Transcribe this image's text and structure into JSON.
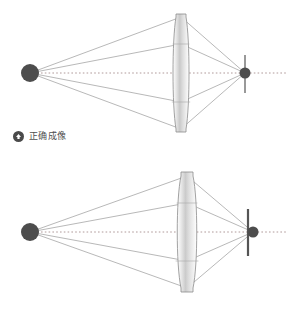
{
  "page": {
    "background_color": "#ffffff",
    "width": 290,
    "height": 309
  },
  "diagrams": [
    {
      "id": "correct",
      "caption": "正确成像",
      "bullet_icon": "up-arrow-icon",
      "bullet_color": "#4a4a4a",
      "text_color": "#4f4f4f",
      "object_point": {
        "x": 30,
        "y": 73,
        "radius": 9,
        "color": "#4d4d4d"
      },
      "lens": {
        "center_x": 181,
        "center_y": 73,
        "half_height": 56,
        "half_width": 9,
        "outline_color": "#8a8a8a",
        "fill_color": "#d8d8d8"
      },
      "sensor_plane": {
        "x": 245,
        "top_y": 55,
        "bottom_y": 93,
        "color": "#6e6e6e",
        "width": 1.4
      },
      "focus_point": {
        "x": 245,
        "y": 73,
        "radius": 5.5,
        "color": "#4d4d4d"
      },
      "optical_axis": {
        "y": 73,
        "start_x": 22,
        "end_x": 286,
        "color": "#b09a9a",
        "style": "dotted"
      },
      "ray_color": "#9a9a9a",
      "ray_heights": [
        17,
        44,
        102,
        129
      ],
      "focus_state": "on-sensor"
    },
    {
      "id": "incorrect",
      "caption": "不正确成像",
      "bullet_icon": "up-arrow-icon",
      "bullet_color": "#4a4a4a",
      "text_color": "#4f4f4f",
      "object_point": {
        "x": 30,
        "y": 232,
        "radius": 9,
        "color": "#4d4d4d"
      },
      "lens": {
        "center_x": 187,
        "center_y": 232,
        "half_height": 57,
        "half_width": 11,
        "outline_color": "#8a8a8a",
        "fill_color": "#d8d8d8"
      },
      "sensor_plane": {
        "x": 248,
        "top_y": 209,
        "bottom_y": 256,
        "color": "#555555",
        "width": 2.2
      },
      "focus_point": {
        "x": 253,
        "y": 232,
        "radius": 5.5,
        "color": "#4d4d4d"
      },
      "optical_axis": {
        "y": 232,
        "start_x": 22,
        "end_x": 286,
        "color": "#b09a9a",
        "style": "dotted"
      },
      "ray_color": "#9a9a9a",
      "ray_heights": [
        176,
        203,
        261,
        288
      ],
      "focus_state": "behind-sensor"
    }
  ]
}
